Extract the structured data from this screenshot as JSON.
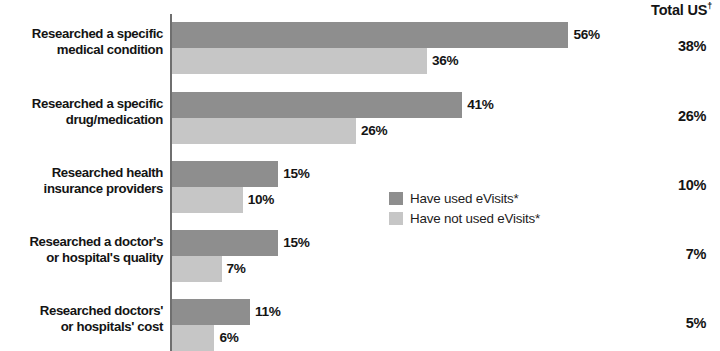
{
  "header": {
    "total_label": "Total US",
    "total_marker": "†"
  },
  "legend": {
    "position": "inside-plot-center",
    "items": [
      {
        "label": "Have used eVisits*",
        "color": "#8e8e8e",
        "key": "used"
      },
      {
        "label": "Have not used eVisits*",
        "color": "#c6c6c6",
        "key": "not_used"
      }
    ]
  },
  "chart_data": {
    "type": "bar",
    "orientation": "horizontal",
    "title": "",
    "subtitle": "",
    "xlabel": "",
    "ylabel": "",
    "xlim": [
      0,
      60
    ],
    "grid": false,
    "legend_position": "center",
    "categories": [
      "Researched a specific\nmedical condition",
      "Researched a specific\ndrug/medication",
      "Researched health\ninsurance  providers",
      "Researched a doctor's\nor hospital's quality",
      "Researched doctors'\nor hospitals' cost"
    ],
    "category_lines": [
      [
        "Researched a specific",
        "medical condition"
      ],
      [
        "Researched a specific",
        "drug/medication"
      ],
      [
        "Researched health",
        "insurance  providers"
      ],
      [
        "Researched a doctor's",
        "or hospital's quality"
      ],
      [
        "Researched doctors'",
        "or hospitals' cost"
      ]
    ],
    "series": [
      {
        "name": "Have used eVisits*",
        "color": "#8e8e8e",
        "values": [
          56,
          41,
          15,
          15,
          11
        ],
        "labels": [
          "56%",
          "41%",
          "15%",
          "15%",
          "11%"
        ]
      },
      {
        "name": "Have not used eVisits*",
        "color": "#c6c6c6",
        "values": [
          36,
          26,
          10,
          7,
          6
        ],
        "labels": [
          "36%",
          "26%",
          "10%",
          "7%",
          "6%"
        ]
      }
    ],
    "total_us_column": {
      "header": "Total US†",
      "values": [
        38,
        26,
        10,
        7,
        5
      ],
      "labels": [
        "38%",
        "26%",
        "10%",
        "7%",
        "5%"
      ]
    }
  }
}
